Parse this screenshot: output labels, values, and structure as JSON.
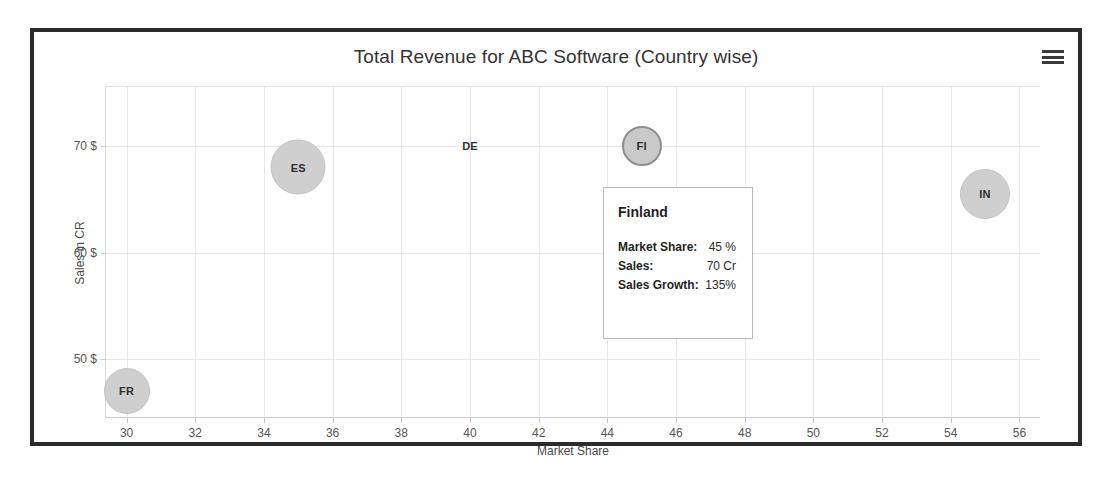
{
  "widget": {
    "title": "Total Revenue for ABC Software (Country wise)",
    "menu_icon": "hamburger-menu-icon",
    "frame_color": "#2b2b2b",
    "bubble_color": "#cfcfcf",
    "grid_color": "#e8e8e8"
  },
  "tooltip": {
    "title": "Finland",
    "rows": [
      {
        "key": "Market Share:",
        "value": "45 %"
      },
      {
        "key": "Sales:",
        "value": "70 Cr"
      },
      {
        "key": "Sales Growth:",
        "value": "135%"
      }
    ]
  },
  "chart_data": {
    "type": "scatter",
    "title": "Total Revenue for ABC Software (Country wise)",
    "xlabel": "Market Share",
    "ylabel": "Sales in CR",
    "xlim": [
      29.4,
      56.6
    ],
    "ylim": [
      44.5,
      75.5
    ],
    "xticks": [
      30,
      32,
      34,
      36,
      38,
      40,
      42,
      44,
      46,
      48,
      50,
      52,
      54,
      56
    ],
    "xtick_labels": [
      "30",
      "32",
      "34",
      "36",
      "38",
      "40",
      "42",
      "44",
      "46",
      "48",
      "50",
      "52",
      "54",
      "56"
    ],
    "yticks": [
      50,
      60,
      70
    ],
    "ytick_labels": [
      "50 $",
      "60 $",
      "70 $"
    ],
    "grid": true,
    "legend": "none",
    "points": [
      {
        "label": "FR",
        "x": 30,
        "y": 47,
        "size": 46,
        "hovered": false
      },
      {
        "label": "ES",
        "x": 35,
        "y": 68,
        "size": 55,
        "hovered": false
      },
      {
        "label": "DE",
        "x": 40,
        "y": 70,
        "size": 0,
        "hovered": false
      },
      {
        "label": "FI",
        "x": 45,
        "y": 70,
        "size": 40,
        "hovered": true
      },
      {
        "label": "IN",
        "x": 55,
        "y": 65.5,
        "size": 50,
        "hovered": false
      }
    ]
  }
}
